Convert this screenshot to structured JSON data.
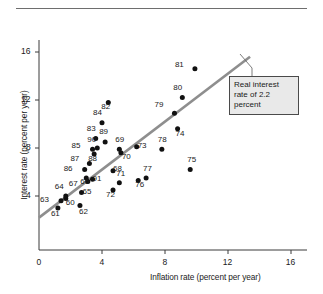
{
  "chart_data": {
    "type": "scatter",
    "title": "",
    "xlabel": "Inflation rate (percent per year)",
    "ylabel": "Interest rate (percent per year)",
    "xlim": [
      0,
      17.5
    ],
    "ylim": [
      1.5,
      17.5
    ],
    "xticks": [
      0,
      4,
      8,
      12,
      16
    ],
    "yticks": [
      4,
      8,
      12,
      16
    ],
    "grid": false,
    "legend": null,
    "annotations": [
      {
        "name": "real-interest-rate-callout",
        "text": "Real interest rate of 2.2 percent",
        "line1": "Real interest",
        "line2": "rate of 2.2",
        "line3": "percent"
      }
    ],
    "trendline": {
      "label": "Real interest rate of 2.2 percent",
      "intercept": 2.2,
      "slope": 1.0,
      "color": "#8e8e8e",
      "x_start": 0.0,
      "x_end": 13.4
    },
    "point_label_field": "year",
    "points": [
      {
        "year": "60",
        "x": 1.7,
        "y": 3.8,
        "lx": 5,
        "ly": 9
      },
      {
        "year": "61",
        "x": 1.2,
        "y": 3.0,
        "lx": -2,
        "ly": 10
      },
      {
        "year": "62",
        "x": 2.6,
        "y": 3.2,
        "lx": 4,
        "ly": 10
      },
      {
        "year": "63",
        "x": 1.4,
        "y": 3.6,
        "lx": -16,
        "ly": 3
      },
      {
        "year": "64",
        "x": 1.7,
        "y": 4.0,
        "lx": -6,
        "ly": -5
      },
      {
        "year": "65",
        "x": 2.7,
        "y": 4.3,
        "lx": 6,
        "ly": 4
      },
      {
        "year": "66",
        "x": 3.0,
        "y": 5.5,
        "lx": -1,
        "ly": 8
      },
      {
        "year": "67",
        "x": 3.1,
        "y": 5.2,
        "lx": -14,
        "ly": 6
      },
      {
        "year": "68",
        "x": 4.7,
        "y": 6.1,
        "lx": 5,
        "ly": 2
      },
      {
        "year": "69",
        "x": 5.1,
        "y": 7.9,
        "lx": 1,
        "ly": -5
      },
      {
        "year": "70",
        "x": 5.2,
        "y": 7.6,
        "lx": 6,
        "ly": 8
      },
      {
        "year": "71",
        "x": 5.1,
        "y": 5.1,
        "lx": 2,
        "ly": -5
      },
      {
        "year": "72",
        "x": 4.7,
        "y": 4.5,
        "lx": -2,
        "ly": 9
      },
      {
        "year": "73",
        "x": 6.2,
        "y": 8.1,
        "lx": 6,
        "ly": 3
      },
      {
        "year": "74",
        "x": 8.8,
        "y": 9.6,
        "lx": 3,
        "ly": 9
      },
      {
        "year": "75",
        "x": 9.6,
        "y": 6.2,
        "lx": 2,
        "ly": -6
      },
      {
        "year": "76",
        "x": 6.3,
        "y": 5.3,
        "lx": 2,
        "ly": 9
      },
      {
        "year": "77",
        "x": 6.8,
        "y": 5.5,
        "lx": 2,
        "ly": -5
      },
      {
        "year": "78",
        "x": 7.8,
        "y": 7.9,
        "lx": 1,
        "ly": -5
      },
      {
        "year": "79",
        "x": 8.6,
        "y": 10.9,
        "lx": -15,
        "ly": -4
      },
      {
        "year": "80",
        "x": 9.1,
        "y": 12.2,
        "lx": -4,
        "ly": -6
      },
      {
        "year": "81",
        "x": 9.9,
        "y": 14.6,
        "lx": -15,
        "ly": 0
      },
      {
        "year": "82",
        "x": 4.4,
        "y": 11.8,
        "lx": -2,
        "ly": 9
      },
      {
        "year": "83",
        "x": 3.6,
        "y": 8.8,
        "lx": -4,
        "ly": -5
      },
      {
        "year": "84",
        "x": 4.0,
        "y": 10.1,
        "lx": -4,
        "ly": -6
      },
      {
        "year": "85",
        "x": 3.4,
        "y": 7.9,
        "lx": -16,
        "ly": 1
      },
      {
        "year": "86",
        "x": 2.9,
        "y": 6.2,
        "lx": -16,
        "ly": 3
      },
      {
        "year": "87",
        "x": 3.2,
        "y": 6.7,
        "lx": -14,
        "ly": -1
      },
      {
        "year": "88",
        "x": 3.5,
        "y": 7.5,
        "lx": -1,
        "ly": 9
      },
      {
        "year": "89",
        "x": 4.2,
        "y": 8.5,
        "lx": -1,
        "ly": -6
      },
      {
        "year": "90",
        "x": 3.7,
        "y": 8.0,
        "lx": -5,
        "ly": -4
      },
      {
        "year": "91",
        "x": 3.4,
        "y": 5.4,
        "lx": 5,
        "ly": 4
      }
    ]
  },
  "axes": {
    "x_tick_labels": [
      "0",
      "4",
      "8",
      "12",
      "16"
    ],
    "y_tick_labels": [
      "4",
      "8",
      "12",
      "16"
    ],
    "x_axis_title": "Inflation rate (percent per year)",
    "y_axis_title": "Interest rate (percent per year)"
  }
}
